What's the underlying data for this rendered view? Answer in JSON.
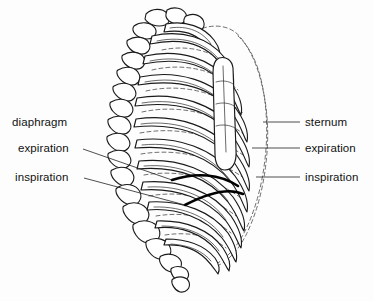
{
  "figure": {
    "background_color": "#fdfdfd",
    "ink_color": "#1a1a1a",
    "ghost_color": "#555555",
    "diaphragm_color": "#000000"
  },
  "labels": {
    "left": [
      {
        "id": "diaphragm",
        "text": "diaphragm",
        "x": 12,
        "y": 126,
        "has_leader": false
      },
      {
        "id": "expiration",
        "text": "expiration",
        "x": 18,
        "y": 152,
        "has_leader": true,
        "leader": {
          "x1": 83,
          "y1": 149,
          "x2": 172,
          "y2": 180
        }
      },
      {
        "id": "inspiration",
        "text": "inspiration",
        "x": 15,
        "y": 181,
        "has_leader": true,
        "leader": {
          "x1": 84,
          "y1": 178,
          "x2": 185,
          "y2": 205
        }
      }
    ],
    "right": [
      {
        "id": "sternum",
        "text": "sternum",
        "x": 305,
        "y": 126,
        "has_leader": true,
        "leader": {
          "x1": 263,
          "y1": 122,
          "x2": 300,
          "y2": 122
        }
      },
      {
        "id": "expiration",
        "text": "expiration",
        "x": 305,
        "y": 152,
        "has_leader": true,
        "leader": {
          "x1": 252,
          "y1": 148,
          "x2": 300,
          "y2": 148
        }
      },
      {
        "id": "inspiration",
        "text": "inspiration",
        "x": 305,
        "y": 181,
        "has_leader": true,
        "leader": {
          "x1": 256,
          "y1": 177,
          "x2": 300,
          "y2": 177
        }
      }
    ]
  },
  "anatomy": {
    "rib_count": 12,
    "spine_segment_count": 14,
    "diaphragm_positions": [
      "expiration",
      "inspiration"
    ],
    "ghost_outline_meaning": "inspiration position of rib cage"
  }
}
